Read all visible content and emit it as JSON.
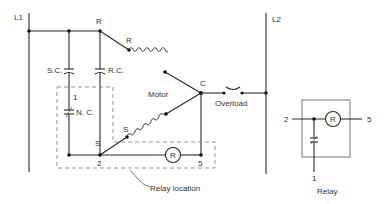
{
  "diagram": {
    "type": "electrical-schematic",
    "lines": {
      "l1": "L1",
      "l2": "L2"
    },
    "components": {
      "start_capacitor": "S.C.",
      "run_capacitor": "R.C.",
      "relay_contact": "N. C.",
      "relay_coil": "R",
      "motor": "Motor",
      "overload": "Overload"
    },
    "terminals": {
      "run_top": "R",
      "run_winding": "R",
      "common": "C",
      "start_winding": "S",
      "start_bottom": "S",
      "relay_1": "1",
      "relay_2": "2",
      "relay_5": "5"
    },
    "annotations": {
      "relay_location": "Relay location"
    },
    "relay_detail": {
      "title": "Relay",
      "terminal_left": "2",
      "terminal_right": "5",
      "terminal_bottom": "1",
      "coil": "R"
    },
    "colors": {
      "wire": "#2a2a2a",
      "dashed_box": "#8a8a8a",
      "text": "#333333",
      "background": "#ffffff"
    }
  }
}
